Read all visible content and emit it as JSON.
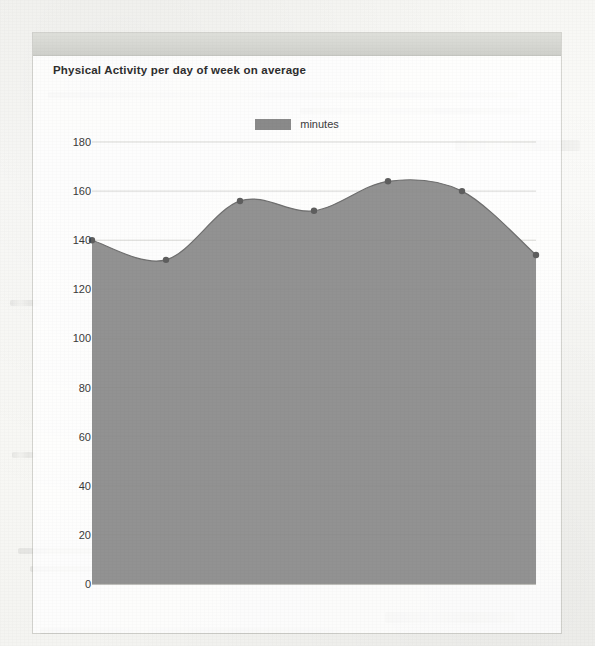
{
  "card": {
    "title": "Physical Activity per day of week on average"
  },
  "legend": {
    "label": "minutes",
    "swatch_color": "#8a8a8a"
  },
  "chart_data": {
    "type": "area",
    "title": "Physical Activity per day of week on average",
    "xlabel": "",
    "ylabel": "",
    "categories": [
      "1",
      "2",
      "3",
      "4",
      "5",
      "6",
      "7"
    ],
    "values": [
      140,
      132,
      156,
      152,
      164,
      160,
      134
    ],
    "series": [
      {
        "name": "minutes",
        "values": [
          140,
          132,
          156,
          152,
          164,
          160,
          134
        ]
      }
    ],
    "ylim": [
      0,
      180
    ],
    "yticks": [
      0,
      20,
      40,
      60,
      80,
      100,
      120,
      140,
      160,
      180
    ],
    "ytick_labels": [
      "0",
      "20",
      "40",
      "60",
      "80",
      "100",
      "120",
      "140",
      "160",
      "180"
    ],
    "xtick_labels": [],
    "grid": true,
    "legend_position": "top-center",
    "area_color": "#8a8a8a",
    "marker_color": "#5e5e5e",
    "smoothed": true
  }
}
